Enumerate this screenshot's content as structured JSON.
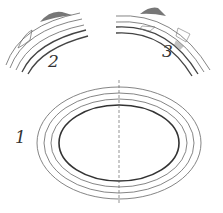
{
  "figure": {
    "panels": [
      {
        "id": "1",
        "label": "1",
        "description": "concentric elliptical rings, cross-section with vertical axis"
      },
      {
        "id": "2",
        "label": "2",
        "description": "arc segment of rings with stippled deposit on outer edge"
      },
      {
        "id": "3",
        "label": "3",
        "description": "arc segment of rings with stippled deposits within layers"
      }
    ],
    "colors": {
      "stroke": "#555555",
      "stipple": "#444444",
      "background": "#ffffff"
    }
  }
}
